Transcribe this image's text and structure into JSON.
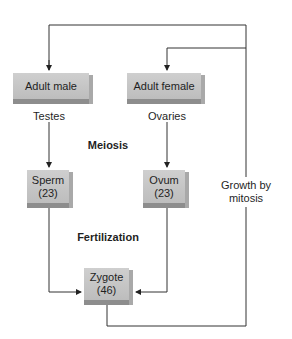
{
  "diagram": {
    "nodes": {
      "adult_male": "Adult male",
      "adult_female": "Adult female",
      "sperm": {
        "name": "Sperm",
        "count": "(23)"
      },
      "ovum": {
        "name": "Ovum",
        "count": "(23)"
      },
      "zygote": {
        "name": "Zygote",
        "count": "(46)"
      }
    },
    "labels": {
      "testes": "Testes",
      "ovaries": "Ovaries",
      "meiosis": "Meiosis",
      "fertilization": "Fertilization",
      "growth_line1": "Growth by",
      "growth_line2": "mitosis"
    },
    "edges": [
      {
        "from": "adult_male",
        "to": "sperm",
        "label": "Testes"
      },
      {
        "from": "adult_female",
        "to": "ovum",
        "label": "Ovaries"
      },
      {
        "from": "sperm",
        "to": "zygote"
      },
      {
        "from": "ovum",
        "to": "zygote"
      },
      {
        "from": "zygote",
        "to": "adult_male",
        "label": "Growth by mitosis"
      },
      {
        "from": "zygote",
        "to": "adult_female",
        "label": "Growth by mitosis"
      }
    ],
    "colors": {
      "box_face": "#c6c6c6",
      "box_shadow": "#8d8d8d",
      "line": "#333333"
    }
  }
}
